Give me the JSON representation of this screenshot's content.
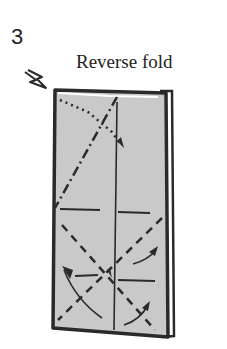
{
  "step": {
    "number": "3",
    "title": "Reverse fold"
  },
  "diagram": {
    "paper_fill": "#c9c9c9",
    "line_color": "#2a2a2a",
    "icons": [
      "push-arrow-icon",
      "fold-arrow-icon"
    ]
  }
}
